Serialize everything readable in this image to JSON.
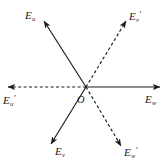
{
  "figure": {
    "type": "vector-star-diagram",
    "origin_label": "O",
    "background_color": "#ffffff",
    "stroke_color": "#1a1a1a",
    "origin": {
      "x": 86,
      "y": 87
    },
    "vectors": [
      {
        "id": "e-u-upper-left",
        "symbol": "E",
        "subscript": "u",
        "prime": "",
        "style": "solid",
        "tip": {
          "x": 44,
          "y": 21
        },
        "label_position": {
          "x": 25,
          "y": 10
        }
      },
      {
        "id": "e-v-prime-upper-right",
        "symbol": "E",
        "subscript": "v",
        "prime": "′",
        "style": "dashed",
        "tip": {
          "x": 126,
          "y": 21
        },
        "label_position": {
          "x": 129,
          "y": 10
        }
      },
      {
        "id": "e-u-prime-left",
        "symbol": "E",
        "subscript": "u",
        "prime": "′",
        "style": "dashed",
        "tip": {
          "x": 8,
          "y": 87
        },
        "label_position": {
          "x": 3,
          "y": 94
        }
      },
      {
        "id": "e-w-right",
        "symbol": "E",
        "subscript": "w",
        "prime": "",
        "style": "solid",
        "tip": {
          "x": 160,
          "y": 87
        },
        "label_position": {
          "x": 145,
          "y": 94
        }
      },
      {
        "id": "e-v-lower-left",
        "symbol": "E",
        "subscript": "v",
        "prime": "",
        "style": "solid",
        "tip": {
          "x": 51,
          "y": 144
        },
        "label_position": {
          "x": 55,
          "y": 146
        }
      },
      {
        "id": "e-w-prime-lower-right",
        "symbol": "E",
        "subscript": "w",
        "prime": "′",
        "style": "dashed",
        "tip": {
          "x": 121,
          "y": 146
        },
        "label_position": {
          "x": 124,
          "y": 146
        }
      }
    ]
  }
}
